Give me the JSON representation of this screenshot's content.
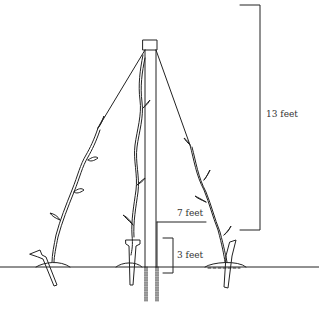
{
  "diagram": {
    "labels": {
      "total_height": "13 feet",
      "upper_mark": "7 feet",
      "lower_mark": "3 feet"
    },
    "elements": {
      "pole": "central pole",
      "strings": 2,
      "vines": 3,
      "stakes": 3
    },
    "colors": {
      "line": "#222222",
      "background": "#ffffff"
    }
  }
}
